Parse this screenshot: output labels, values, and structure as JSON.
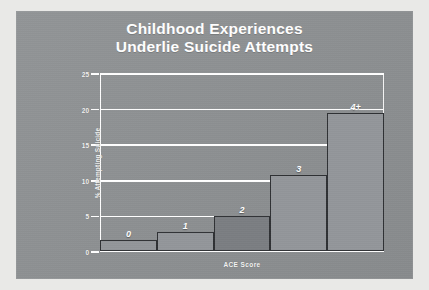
{
  "slide": {
    "background_color": "#8d9092",
    "frame_color": "#e9e9e7"
  },
  "title": {
    "line1": "Childhood Experiences",
    "line2": "Underlie Suicide Attempts",
    "color": "#ffffff"
  },
  "chart_data": {
    "type": "bar",
    "title": "Childhood Experiences Underlie Suicide Attempts",
    "xlabel": "ACE Score",
    "ylabel": "% Attempting Suicide",
    "categories": [
      "0",
      "1",
      "2",
      "3",
      "4+"
    ],
    "values": [
      1.5,
      2.7,
      4.9,
      10.7,
      19.4
    ],
    "ylim": [
      0,
      25
    ],
    "yticks": [
      0,
      5,
      10,
      15,
      20,
      25
    ],
    "ytick_labels": [
      "0",
      "5",
      "10",
      "15",
      "20",
      "25"
    ],
    "grid": true,
    "grid_color": "#ffffff",
    "legend": false,
    "bar_fill": "#93969a",
    "bar_fill_highlight": "#7b7e82",
    "bar_edge": "#2f3134",
    "highlight_category": "2",
    "data_labels_position": "above-bar",
    "data_labels": [
      "0",
      "1",
      "2",
      "3",
      "4+"
    ]
  }
}
